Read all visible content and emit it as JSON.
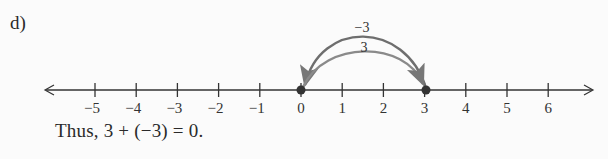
{
  "part_label": "d)",
  "number_line": {
    "min": -5,
    "max": 6,
    "ticks": [
      "−5",
      "−4",
      "−3",
      "−2",
      "−1",
      "0",
      "1",
      "2",
      "3",
      "4",
      "5",
      "6"
    ],
    "points": [
      0,
      3
    ],
    "arrows": [
      {
        "from": 0,
        "to": 3,
        "label": "3",
        "color": "#7a7a7a"
      },
      {
        "from": 3,
        "to": 0,
        "label": "−3",
        "color": "#6e6e6e"
      }
    ]
  },
  "conclusion": "Thus, 3 + (−3) = 0.",
  "colors": {
    "axis": "#333333",
    "arc": "#777777",
    "point": "#333333"
  }
}
